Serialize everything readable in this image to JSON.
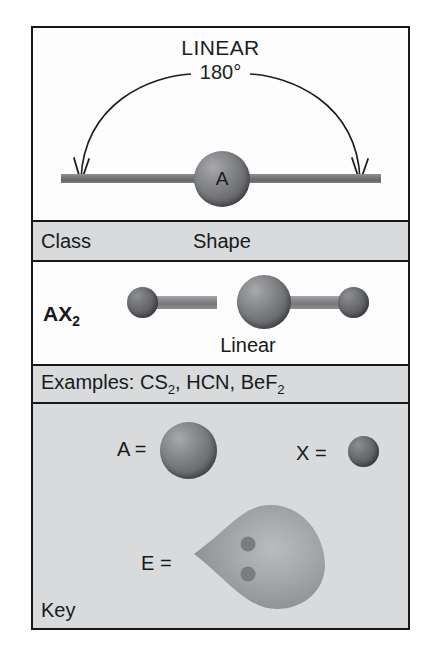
{
  "figure": {
    "shape_title": "LINEAR",
    "bond_angle": "180°",
    "central_atom_label": "A"
  },
  "table": {
    "headers": {
      "class": "Class",
      "shape": "Shape"
    },
    "row": {
      "class_formula_main": "AX",
      "class_formula_sub": "2",
      "shape_name": "Linear"
    },
    "examples": {
      "label": "Examples:",
      "items": [
        {
          "main": "CS",
          "sub": "2",
          "trailing": ","
        },
        {
          "main": "HCN",
          "sub": "",
          "trailing": ","
        },
        {
          "main": "BeF",
          "sub": "2",
          "trailing": ""
        }
      ],
      "full_text": "Examples: CS2, HCN, BeF2"
    }
  },
  "key": {
    "caption": "Key",
    "entries": [
      {
        "name": "central-atom",
        "label": "A =",
        "glyph": "large-sphere"
      },
      {
        "name": "bonded-atom",
        "label": "X =",
        "glyph": "small-sphere"
      },
      {
        "name": "lone-pair",
        "label": "E =",
        "glyph": "lone-pair-lobe"
      }
    ]
  },
  "colors": {
    "frame_border": "#16181a",
    "panel_white": "#fdfdfd",
    "panel_gray": "#d9dadb",
    "atom_a": "#7e8083",
    "atom_x": "#65676a",
    "bond": "#8a8c8f",
    "lone_pair_lobe": "#9fa1a3",
    "text": "#17191b"
  }
}
